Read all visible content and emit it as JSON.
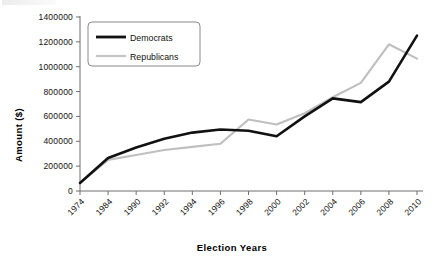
{
  "chart_data": {
    "type": "line",
    "title": "",
    "xlabel": "Election Years",
    "ylabel": "Amount ($)",
    "categories": [
      "1974",
      "1984",
      "1990",
      "1992",
      "1994",
      "1996",
      "1998",
      "2000",
      "2002",
      "2004",
      "2006",
      "2008",
      "2010"
    ],
    "ylim": [
      0,
      1400000
    ],
    "ytick_labels": [
      "1400000",
      "1200000",
      "1000000",
      "800000",
      "600000",
      "400000",
      "200000",
      "0"
    ],
    "ytick_values": [
      1400000,
      1200000,
      1000000,
      800000,
      600000,
      400000,
      200000,
      0
    ],
    "grid": false,
    "legend_position": "top-left-inside",
    "series": [
      {
        "name": "Democrats",
        "color": "#111111",
        "values": [
          65000,
          265000,
          350000,
          420000,
          470000,
          495000,
          485000,
          440000,
          600000,
          745000,
          715000,
          880000,
          1250000
        ]
      },
      {
        "name": "Republicans",
        "color": "#bfbfbf",
        "values": [
          65000,
          250000,
          290000,
          330000,
          355000,
          380000,
          575000,
          535000,
          625000,
          755000,
          870000,
          1180000,
          1065000
        ]
      }
    ]
  },
  "legend": {
    "entries": [
      {
        "label": "Democrats",
        "swatch": "line-swatch-black"
      },
      {
        "label": "Republicans",
        "swatch": "line-swatch-gray"
      }
    ]
  },
  "axes": {
    "y_title": "Amount ($)",
    "x_title": "Election Years"
  }
}
